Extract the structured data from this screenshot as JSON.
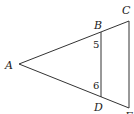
{
  "diagram": {
    "type": "geometry-figure",
    "points": {
      "A": {
        "label": "A",
        "x": 19,
        "y": 64
      },
      "B": {
        "label": "B",
        "x": 101,
        "y": 32
      },
      "C": {
        "label": "C",
        "x": 129,
        "y": 21
      },
      "D": {
        "label": "D",
        "x": 101,
        "y": 97
      },
      "E": {
        "label": "E",
        "x": 129,
        "y": 108
      }
    },
    "segments": [
      [
        "A",
        "C"
      ],
      [
        "A",
        "E"
      ],
      [
        "B",
        "D"
      ],
      [
        "C",
        "E"
      ]
    ],
    "angle_labels": {
      "angle_at_B": "5",
      "angle_at_D": "6"
    },
    "stroke_color": "#333333",
    "background": "#ffffff"
  }
}
